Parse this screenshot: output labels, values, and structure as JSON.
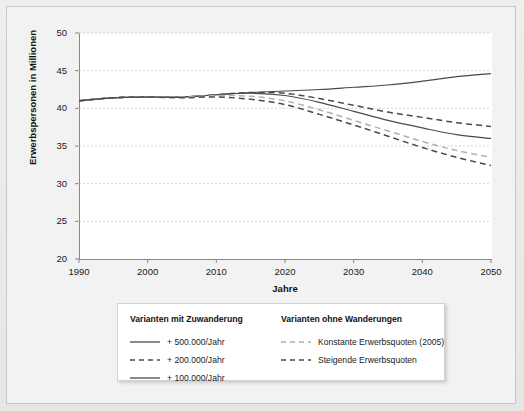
{
  "chart_data": {
    "type": "line",
    "title": "",
    "xlabel": "Jahre",
    "ylabel": "Erwerbspersonen in Millionen",
    "xlim": [
      1990,
      2050
    ],
    "ylim": [
      20,
      50
    ],
    "xticks": [
      "1990",
      "2000",
      "2010",
      "2020",
      "2030",
      "2040",
      "2050"
    ],
    "yticks": [
      "50",
      "45",
      "40",
      "35",
      "30",
      "25",
      "20"
    ],
    "grid": true,
    "legend_position": "below-plot",
    "x": [
      1990,
      1995,
      2000,
      2005,
      2010,
      2015,
      2020,
      2025,
      2030,
      2035,
      2040,
      2045,
      2050
    ],
    "series": [
      {
        "name": "+ 500.000/Jahr",
        "group": "Varianten mit Zuwanderung",
        "style": "solid",
        "color": "#4a4a4a",
        "values": [
          41.0,
          41.4,
          41.5,
          41.5,
          41.8,
          42.1,
          42.3,
          42.5,
          42.8,
          43.1,
          43.6,
          44.2,
          44.6
        ]
      },
      {
        "name": "+ 200.000/Jahr",
        "group": "Varianten mit Zuwanderung",
        "style": "dashed",
        "color": "#4a4a4a",
        "values": [
          41.0,
          41.4,
          41.5,
          41.5,
          41.8,
          42.1,
          42.0,
          41.3,
          40.4,
          39.5,
          38.8,
          38.1,
          37.6
        ]
      },
      {
        "name": "+ 100.000/Jahr",
        "group": "Varianten mit Zuwanderung",
        "style": "solid",
        "color": "#4a4a4a",
        "values": [
          41.0,
          41.4,
          41.5,
          41.5,
          41.8,
          42.0,
          41.7,
          40.8,
          39.6,
          38.4,
          37.4,
          36.5,
          36.0
        ]
      },
      {
        "name": "Konstante Erwerbsquoten (2005)",
        "group": "Varianten ohne Wanderungen",
        "style": "dashed",
        "color": "#b0b0b0",
        "values": [
          41.0,
          41.4,
          41.5,
          41.5,
          41.7,
          41.6,
          41.0,
          39.8,
          38.4,
          37.0,
          35.6,
          34.4,
          33.5
        ]
      },
      {
        "name": "Steigende Erwerbsquoten",
        "group": "Varianten ohne Wanderungen",
        "style": "dashed",
        "color": "#4a4a4a",
        "values": [
          41.0,
          41.4,
          41.5,
          41.4,
          41.5,
          41.2,
          40.5,
          39.2,
          37.8,
          36.3,
          34.8,
          33.5,
          32.4
        ]
      }
    ]
  },
  "legend": {
    "groups": [
      {
        "title": "Varianten mit Zuwanderung",
        "entries": [
          {
            "label": "+ 500.000/Jahr",
            "style": "solid",
            "color": "#4a4a4a"
          },
          {
            "label": "+ 200.000/Jahr",
            "style": "dashed",
            "color": "#4a4a4a"
          },
          {
            "label": "+ 100.000/Jahr",
            "style": "solid",
            "color": "#4a4a4a"
          }
        ]
      },
      {
        "title": "Varianten ohne Wanderungen",
        "entries": [
          {
            "label": "Konstante Erwerbsquoten (2005)",
            "style": "dashed",
            "color": "#b0b0b0"
          },
          {
            "label": "Steigende Erwerbsquoten",
            "style": "dashed",
            "color": "#4a4a4a"
          }
        ]
      }
    ]
  },
  "colors": {
    "background": "#ebebeb",
    "panel": "#ffffff",
    "axis": "#888888",
    "grid": "#c9c9c9",
    "line_dark": "#4a4a4a",
    "line_light": "#b0b0b0"
  }
}
